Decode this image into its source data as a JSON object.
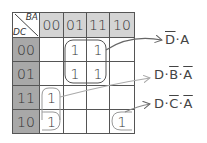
{
  "corner": {
    "top_label": "BA",
    "side_label": "DC"
  },
  "columns": [
    "00",
    "01",
    "11",
    "10"
  ],
  "rows": [
    {
      "label": "00",
      "cells": [
        "",
        "1",
        "1",
        ""
      ]
    },
    {
      "label": "01",
      "cells": [
        "",
        "1",
        "1",
        ""
      ]
    },
    {
      "label": "11",
      "cells": [
        "1",
        "",
        "",
        ""
      ]
    },
    {
      "label": "10",
      "cells": [
        "1",
        "",
        "",
        "1"
      ]
    }
  ],
  "groups": [
    {
      "term_parts": [
        {
          "t": "D",
          "bar": true
        },
        {
          "t": "·",
          "bar": false
        },
        {
          "t": "A",
          "bar": false
        }
      ],
      "text": "D̄·A"
    },
    {
      "term_parts": [
        {
          "t": "D",
          "bar": false
        },
        {
          "t": "·",
          "bar": false
        },
        {
          "t": "B",
          "bar": true
        },
        {
          "t": "·",
          "bar": false
        },
        {
          "t": "A",
          "bar": true
        }
      ],
      "text": "D·B̄·Ā"
    },
    {
      "term_parts": [
        {
          "t": "D",
          "bar": false
        },
        {
          "t": "·",
          "bar": false
        },
        {
          "t": "C",
          "bar": true
        },
        {
          "t": "·",
          "bar": false
        },
        {
          "t": "A",
          "bar": true
        }
      ],
      "text": "D·C̄·Ā"
    }
  ],
  "colors": {
    "header": "#d4d4d4",
    "row_header": "#a8a8a8",
    "grid_line": "#555555",
    "arrow_dark": "#666666",
    "arrow_light": "#b0b0b0"
  }
}
